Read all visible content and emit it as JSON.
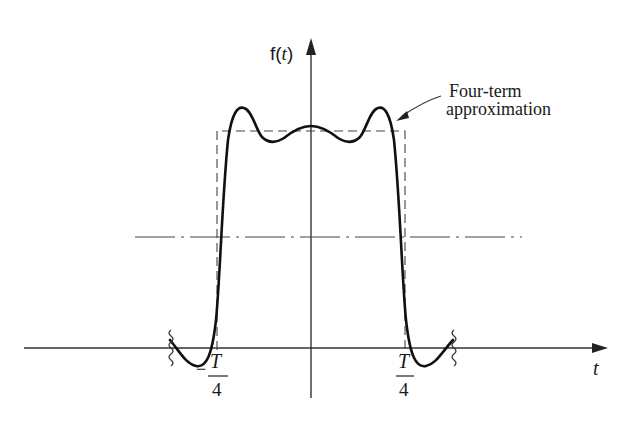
{
  "figure": {
    "y_axis_label": "f(t)",
    "y_axis_label_parts": {
      "func": "f(",
      "var": "t",
      "close": ")"
    },
    "x_axis_label": "t",
    "annotation": {
      "line1": "Four-term",
      "line2": "approximation"
    },
    "ticks": {
      "left": {
        "sign": "−",
        "numerator": "T",
        "denominator": "4"
      },
      "right": {
        "numerator": "T",
        "denominator": "4"
      }
    },
    "curves": [
      {
        "name": "square-wave",
        "style": "dashed"
      },
      {
        "name": "four-term-approximation",
        "style": "solid-thick"
      },
      {
        "name": "average-level",
        "style": "dash-dot"
      }
    ]
  }
}
